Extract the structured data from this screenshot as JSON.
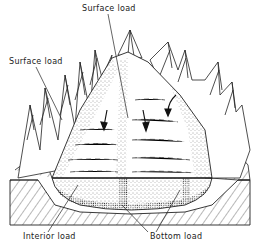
{
  "figure": {
    "type": "glacier-debris-load cross-section",
    "labels": {
      "surface_load_top": "Surface load",
      "surface_load_left": "Surface load",
      "interior_load": "Interior load",
      "bottom_load": "Bottom load"
    },
    "colors": {
      "ink": "#222222",
      "background": "#ffffff"
    },
    "arrows": [
      {
        "direction": "down",
        "position": "left lobe"
      },
      {
        "direction": "down",
        "position": "center lobe"
      },
      {
        "direction": "down-curved",
        "position": "right tributary"
      }
    ]
  }
}
